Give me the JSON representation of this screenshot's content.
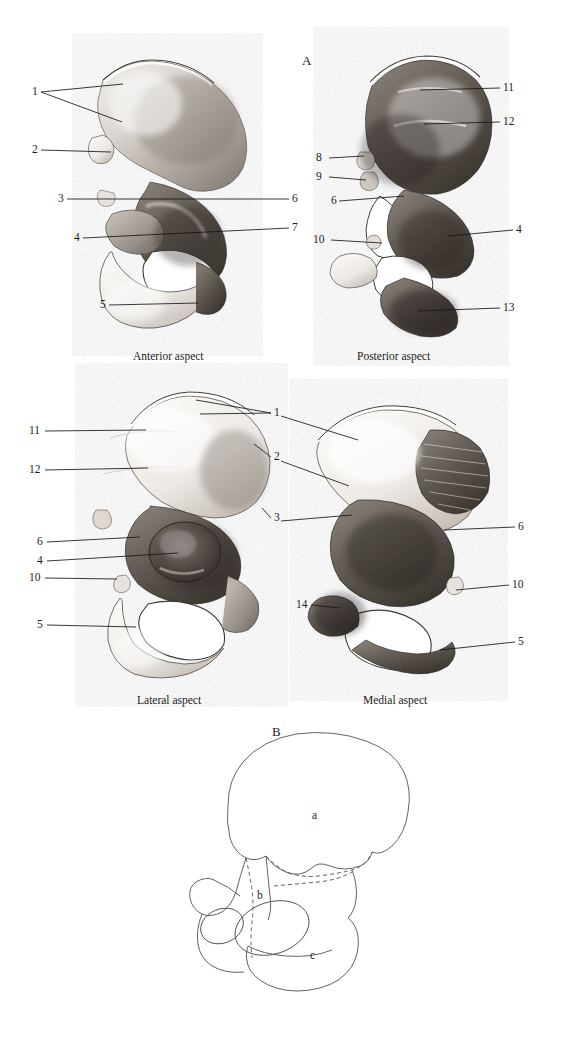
{
  "figure": {
    "panel_a_letter": "A",
    "panel_b_letter": "B"
  },
  "panels": [
    {
      "id": "anterior",
      "caption": "Anterior aspect",
      "caption_x": 133,
      "caption_y": 356,
      "left_labels": [
        {
          "text": "1",
          "x": 32,
          "y": 92
        },
        {
          "text": "2",
          "x": 32,
          "y": 150
        },
        {
          "text": "3",
          "x": 58,
          "y": 199
        },
        {
          "text": "4",
          "x": 74,
          "y": 238
        },
        {
          "text": "5",
          "x": 100,
          "y": 305
        }
      ],
      "right_labels": [
        {
          "text": "6",
          "x": 290,
          "y": 199
        },
        {
          "text": "7",
          "x": 290,
          "y": 228
        }
      ]
    },
    {
      "id": "posterior",
      "caption": "Posterior aspect",
      "caption_x": 357,
      "caption_y": 356,
      "left_labels": [
        {
          "text": "8",
          "x": 316,
          "y": 158
        },
        {
          "text": "9",
          "x": 316,
          "y": 177
        },
        {
          "text": "6",
          "x": 330,
          "y": 201
        },
        {
          "text": "10",
          "x": 314,
          "y": 238
        }
      ],
      "right_labels": [
        {
          "text": "11",
          "x": 503,
          "y": 88
        },
        {
          "text": "12",
          "x": 503,
          "y": 122
        },
        {
          "text": "4",
          "x": 517,
          "y": 230
        },
        {
          "text": "13",
          "x": 503,
          "y": 308
        }
      ]
    },
    {
      "id": "lateral",
      "caption": "Lateral aspect",
      "caption_x": 137,
      "caption_y": 700,
      "left_labels": [
        {
          "text": "11",
          "x": 30,
          "y": 431
        },
        {
          "text": "12",
          "x": 30,
          "y": 470
        },
        {
          "text": "6",
          "x": 38,
          "y": 542
        },
        {
          "text": "4",
          "x": 38,
          "y": 561
        },
        {
          "text": "10",
          "x": 30,
          "y": 578
        },
        {
          "text": "5",
          "x": 38,
          "y": 625
        }
      ],
      "right_labels": []
    },
    {
      "id": "medial",
      "caption": "Medial aspect",
      "caption_x": 363,
      "caption_y": 700,
      "left_labels": [
        {
          "text": "14",
          "x": 297,
          "y": 605
        }
      ],
      "right_labels": [
        {
          "text": "6",
          "x": 518,
          "y": 527
        },
        {
          "text": "10",
          "x": 512,
          "y": 585
        },
        {
          "text": "5",
          "x": 518,
          "y": 642
        }
      ]
    }
  ],
  "shared_labels_middle": [
    {
      "text": "1",
      "x": 274,
      "y": 413
    },
    {
      "text": "2",
      "x": 274,
      "y": 457
    },
    {
      "text": "3",
      "x": 274,
      "y": 518
    }
  ],
  "panel_b": {
    "letter": "B",
    "letter_x": 272,
    "letter_y": 731,
    "region_letters": [
      {
        "text": "a",
        "x": 312,
        "y": 815
      },
      {
        "text": "b",
        "x": 257,
        "y": 895
      },
      {
        "text": "c",
        "x": 310,
        "y": 955
      }
    ]
  },
  "colors": {
    "ink": "#1d1d1d",
    "leader": "#161616",
    "outline": "#3a3a3a",
    "background": "#ffffff"
  }
}
